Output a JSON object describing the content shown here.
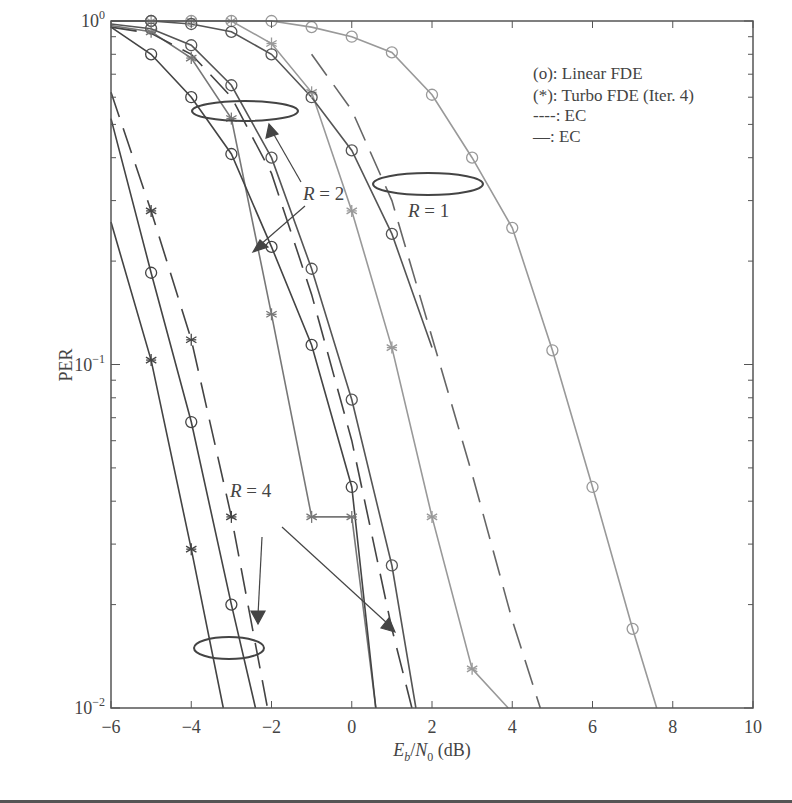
{
  "chart_data": {
    "type": "line",
    "title": "",
    "xlabel": "E_b/N_0 (dB)",
    "xlabel_parts": {
      "E": "E",
      "b": "b",
      "slash": "/",
      "N": "N",
      "zero": "0",
      "unit": " (dB)"
    },
    "ylabel": "PER",
    "xlim": [
      -6,
      10
    ],
    "ylim": [
      0.01,
      1
    ],
    "yscale": "log",
    "grid": false,
    "x_ticks": [
      -6,
      -4,
      -2,
      0,
      2,
      4,
      6,
      8,
      10
    ],
    "x_tick_labels": [
      "−6",
      "−4",
      "−2",
      "0",
      "2",
      "4",
      "6",
      "8",
      "10"
    ],
    "y_ticks": [
      1,
      0.1,
      0.01
    ],
    "y_tick_labels": [
      {
        "base": "10",
        "exp": "0"
      },
      {
        "base": "10",
        "exp": "−1"
      },
      {
        "base": "10",
        "exp": "−2"
      }
    ],
    "legend": {
      "position": "upper right",
      "entries": [
        "(o): Linear FDE",
        "(*): Turbo FDE (Iter. 4)",
        "----: EC",
        "—: EC"
      ]
    },
    "annotations": [
      {
        "text": "R = 1",
        "italic_var": "R",
        "value": " = 1"
      },
      {
        "text": "R = 2",
        "italic_var": "R",
        "value": " = 2"
      },
      {
        "text": "R = 4",
        "italic_var": "R",
        "value": " = 4"
      }
    ],
    "series": [
      {
        "name": "R=1 Linear FDE",
        "group": "R=1",
        "marker": "o",
        "style": "solid",
        "color": "#999999",
        "x": [
          -6,
          -5,
          -4,
          -3,
          -2,
          -1,
          0,
          1,
          2,
          3,
          4,
          5,
          6,
          7,
          7.6
        ],
        "y": [
          1,
          1,
          1,
          1,
          1,
          0.96,
          0.9,
          0.81,
          0.61,
          0.4,
          0.25,
          0.11,
          0.044,
          0.017,
          0.01
        ]
      },
      {
        "name": "R=1 Turbo FDE",
        "group": "R=1",
        "marker": "*",
        "style": "solid",
        "color": "#999999",
        "x": [
          -6,
          -5,
          -4,
          -3,
          -2,
          -1,
          0,
          1,
          2,
          3,
          3.9
        ],
        "y": [
          1,
          1,
          1,
          1,
          0.86,
          0.62,
          0.28,
          0.112,
          0.036,
          0.013,
          0.01
        ]
      },
      {
        "name": "R=1 EC (dashed)",
        "group": "R=1",
        "marker": "",
        "style": "dashed",
        "color": "#666666",
        "x": [
          -1,
          0,
          1,
          2,
          3,
          4,
          4.7
        ],
        "y": [
          0.8,
          0.55,
          0.3,
          0.12,
          0.048,
          0.018,
          0.01
        ]
      },
      {
        "name": "R=2 Linear FDE a",
        "group": "R=2",
        "marker": "o",
        "style": "solid",
        "color": "#555555",
        "x": [
          -6,
          -5,
          -4,
          -3,
          -2,
          -1,
          0,
          1,
          2
        ],
        "y": [
          1,
          1,
          0.98,
          0.93,
          0.8,
          0.6,
          0.42,
          0.24,
          0.112
        ]
      },
      {
        "name": "R=2 Linear FDE b",
        "group": "R=2",
        "marker": "o",
        "style": "solid",
        "color": "#555555",
        "x": [
          -6,
          -5,
          -4,
          -3,
          -2,
          -1,
          0,
          1,
          1.6
        ],
        "y": [
          0.98,
          0.95,
          0.85,
          0.65,
          0.4,
          0.19,
          0.079,
          0.026,
          0.01
        ]
      },
      {
        "name": "R=2 Turbo FDE",
        "group": "R=2",
        "marker": "*",
        "style": "solid",
        "color": "#777777",
        "x": [
          -6,
          -5,
          -4,
          -3,
          -2,
          -1,
          0,
          0.6
        ],
        "y": [
          0.97,
          0.93,
          0.78,
          0.52,
          0.14,
          0.036,
          0.036,
          0.01
        ]
      },
      {
        "name": "R=2 EC (dashed)",
        "group": "R=2",
        "marker": "",
        "style": "dashed",
        "color": "#444444",
        "x": [
          -6,
          -5,
          -4,
          -3,
          -2,
          -1,
          0,
          1,
          1.5
        ],
        "y": [
          0.96,
          0.92,
          0.8,
          0.6,
          0.36,
          0.16,
          0.06,
          0.017,
          0.01
        ]
      },
      {
        "name": "R=2 Linear FDE c",
        "group": "R=2",
        "marker": "o",
        "style": "solid",
        "color": "#444444",
        "x": [
          -6,
          -5,
          -4,
          -3,
          -2,
          -1,
          0,
          0.6
        ],
        "y": [
          0.96,
          0.8,
          0.6,
          0.41,
          0.22,
          0.114,
          0.044,
          0.01
        ]
      },
      {
        "name": "R=4 Turbo FDE",
        "group": "R=4",
        "marker": "*",
        "style": "solid",
        "color": "#444444",
        "x": [
          -6,
          -5,
          -4,
          -3.2
        ],
        "y": [
          0.26,
          0.103,
          0.029,
          0.01
        ]
      },
      {
        "name": "R=4 Linear FDE",
        "group": "R=4",
        "marker": "o",
        "style": "solid",
        "color": "#444444",
        "x": [
          -6,
          -5,
          -4,
          -3,
          -2.4
        ],
        "y": [
          0.52,
          0.185,
          0.068,
          0.02,
          0.01
        ]
      },
      {
        "name": "R=4 EC (dashed)",
        "group": "R=4",
        "marker": "*",
        "style": "dashed",
        "color": "#444444",
        "x": [
          -6,
          -5,
          -4,
          -3,
          -2.1
        ],
        "y": [
          0.62,
          0.28,
          0.118,
          0.036,
          0.01
        ]
      }
    ]
  }
}
